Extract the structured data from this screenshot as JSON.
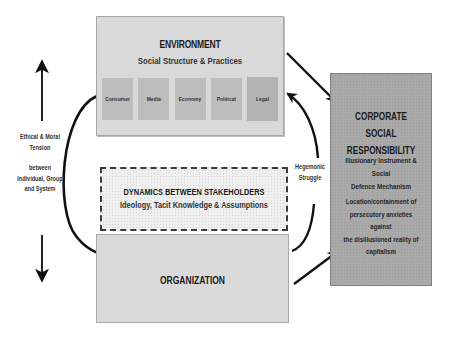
{
  "environment": {
    "title": "ENVIRONMENT",
    "subtitle": "Social Structure & Practices",
    "elements": [
      {
        "label": "Consumer"
      },
      {
        "label": "Media"
      },
      {
        "label": "Economy"
      },
      {
        "label": "Political"
      },
      {
        "label": "Legal"
      }
    ]
  },
  "dynamics": {
    "title": "DYNAMICS BETWEEN STAKEHOLDERS",
    "subtitle": "Ideology, Tacit Knowledge & Assumptions"
  },
  "organization": {
    "title": "ORGANIZATION"
  },
  "csr": {
    "title_line1": "CORPORATE SOCIAL",
    "title_line2": "RESPONSIBILITY",
    "sub_line1": "Illusionary Instrument & Social",
    "sub_line2": "Defence Mechanism",
    "desc_line1": "Location/containment of",
    "desc_line2": "persecutory anxieties against",
    "desc_line3": "the disillusioned reality of",
    "desc_line4": "capitalism"
  },
  "left_label": {
    "line1": "Ethical & Moral",
    "line2": "Tension",
    "line3": "between",
    "line4": "Individual, Group",
    "line5": "and System"
  },
  "right_label": {
    "line1": "Hegemonic",
    "line2": "Struggle"
  },
  "colors": {
    "environment_fill": "#d9d9d9",
    "element_fill": "#bdbdbd",
    "organization_fill": "#dadada",
    "csr_fill": "#a9a9a9",
    "arrow": "#111111"
  }
}
